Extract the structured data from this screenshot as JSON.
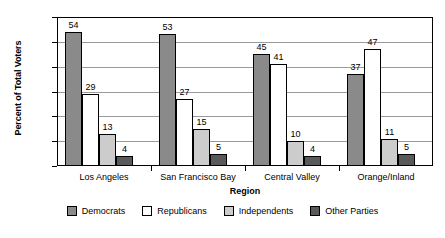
{
  "chart_data": {
    "type": "bar",
    "title": "",
    "xlabel": "Region",
    "ylabel": "Percent of Total Voters",
    "ylim": [
      0,
      60
    ],
    "ytick_step": 10,
    "yticks": [
      0,
      10,
      20,
      30,
      40,
      50,
      60
    ],
    "grid": true,
    "legend_position": "bottom",
    "categories": [
      "Los Angeles",
      "San Francisco Bay",
      "Central Valley",
      "Orange/Inland"
    ],
    "series": [
      {
        "name": "Democrats",
        "values": [
          54,
          53,
          45,
          37
        ],
        "color": "#8a8a8a"
      },
      {
        "name": "Republicans",
        "values": [
          29,
          27,
          41,
          47
        ],
        "color": "#ffffff"
      },
      {
        "name": "Independents",
        "values": [
          13,
          15,
          10,
          11
        ],
        "color": "#cccccc"
      },
      {
        "name": "Other Parties",
        "values": [
          4,
          5,
          4,
          5
        ],
        "color": "#595959"
      }
    ]
  }
}
